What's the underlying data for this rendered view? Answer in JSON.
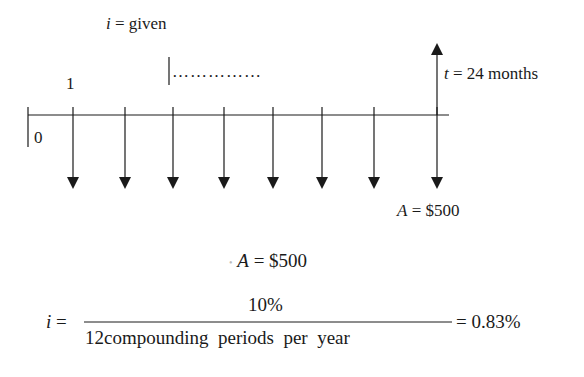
{
  "diagram": {
    "type": "cash-flow-timeline",
    "interest_label": {
      "var": "i",
      "eq": " = given"
    },
    "period_start_label": "0",
    "period_first_label": "1",
    "ellipsis": "……………",
    "horizon_label": {
      "var": "t",
      "eq": " = 24 months"
    },
    "payment_label": {
      "var": "A",
      "eq": " = $500"
    },
    "payment_arrows_x": [
      73,
      125,
      173,
      224,
      273,
      322,
      374,
      437
    ],
    "colors": {
      "line": "#1a1a1a",
      "background": "#ffffff"
    }
  },
  "formulas": {
    "payment": {
      "var": "A",
      "eq": " = $500"
    },
    "rate": {
      "lhs_var": "i",
      "lhs_eq": " =",
      "numerator": "10%",
      "denominator": "12compounding  periods  per  year",
      "result": "= 0.83%"
    }
  }
}
